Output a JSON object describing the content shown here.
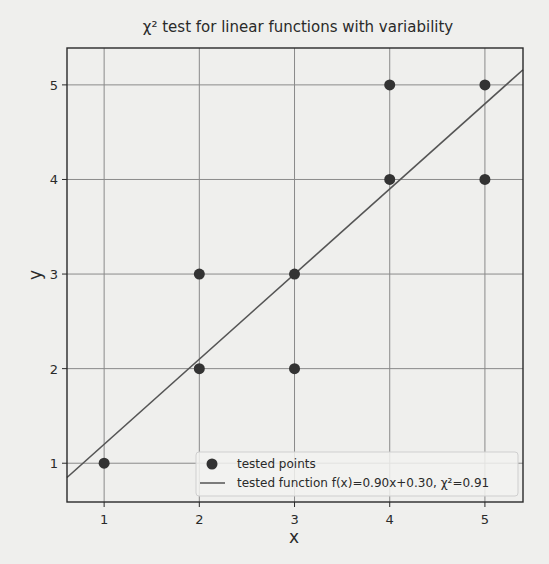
{
  "chart_data": {
    "type": "scatter",
    "title": "χ² test for linear functions with variability",
    "xlabel": "x",
    "ylabel": "y",
    "xlim": [
      0.61,
      5.4
    ],
    "ylim": [
      0.59,
      5.39
    ],
    "grid": true,
    "x_ticks": [
      1,
      2,
      3,
      4,
      5
    ],
    "y_ticks": [
      1,
      2,
      3,
      4,
      5
    ],
    "x_tick_labels": [
      "1",
      "2",
      "3",
      "4",
      "5"
    ],
    "y_tick_labels": [
      "1",
      "2",
      "3",
      "4",
      "5"
    ],
    "series": [
      {
        "name": "tested points",
        "kind": "scatter",
        "x": [
          1,
          2,
          2,
          3,
          3,
          4,
          4,
          5,
          5
        ],
        "y": [
          1,
          2,
          3,
          2,
          3,
          4,
          5,
          4,
          5
        ],
        "color": "#333333"
      },
      {
        "name": "tested function f(x)=0.90x+0.30, χ²=0.91",
        "kind": "line",
        "slope": 0.9,
        "intercept": 0.3,
        "chi2": 0.91,
        "color": "#555555"
      }
    ],
    "legend": {
      "placement": "lower-right",
      "entries": [
        "tested points",
        "tested function f(x)=0.90x+0.30, χ²=0.91"
      ]
    }
  }
}
